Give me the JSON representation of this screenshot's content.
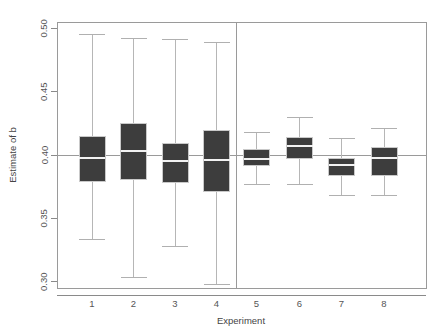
{
  "chart_data": {
    "type": "box",
    "title": "",
    "xlabel": "Experiment",
    "ylabel": "Estimate of b",
    "ylim": [
      0.295,
      0.505
    ],
    "yticks": [
      0.3,
      0.35,
      0.4,
      0.45,
      0.5
    ],
    "ytick_labels": [
      "0.30",
      "0.35",
      "0.40",
      "0.45",
      "0.50"
    ],
    "xticks": [
      1,
      2,
      3,
      4,
      5,
      6,
      7,
      8
    ],
    "xtick_labels": [
      "1",
      "2",
      "3",
      "4",
      "5",
      "6",
      "7",
      "8"
    ],
    "grid": false,
    "legend": null,
    "reference_line": {
      "orientation": "horizontal",
      "value": 0.4,
      "label": "true value b = 0.40"
    },
    "panel_divider": {
      "orientation": "vertical",
      "between_categories": [
        4,
        5
      ],
      "label": "group separator"
    },
    "categories": [
      "1",
      "2",
      "3",
      "4",
      "5",
      "6",
      "7",
      "8"
    ],
    "boxes": [
      {
        "category": "1",
        "whisker_low": 0.333,
        "q1": 0.379,
        "median": 0.398,
        "q3": 0.415,
        "whisker_high": 0.495
      },
      {
        "category": "2",
        "whisker_low": 0.303,
        "q1": 0.381,
        "median": 0.403,
        "q3": 0.425,
        "whisker_high": 0.492
      },
      {
        "category": "3",
        "whisker_low": 0.328,
        "q1": 0.378,
        "median": 0.395,
        "q3": 0.409,
        "whisker_high": 0.491
      },
      {
        "category": "4",
        "whisker_low": 0.298,
        "q1": 0.371,
        "median": 0.396,
        "q3": 0.419,
        "whisker_high": 0.489
      },
      {
        "category": "5",
        "whisker_low": 0.377,
        "q1": 0.392,
        "median": 0.397,
        "q3": 0.404,
        "whisker_high": 0.418
      },
      {
        "category": "6",
        "whisker_low": 0.377,
        "q1": 0.397,
        "median": 0.407,
        "q3": 0.414,
        "whisker_high": 0.43
      },
      {
        "category": "7",
        "whisker_low": 0.368,
        "q1": 0.384,
        "median": 0.392,
        "q3": 0.397,
        "whisker_high": 0.413
      },
      {
        "category": "8",
        "whisker_low": 0.368,
        "q1": 0.384,
        "median": 0.398,
        "q3": 0.406,
        "whisker_high": 0.421
      }
    ],
    "colors": {
      "box_fill": "#3d3d3d",
      "box_border": "#c9c9c9",
      "median": "#f2f2f2",
      "whisker": "#b6b6b6",
      "axis": "#9a9a9a",
      "text": "#555555",
      "background": "#ffffff"
    }
  }
}
